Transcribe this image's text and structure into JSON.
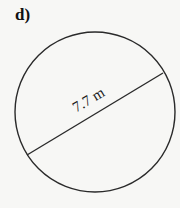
{
  "problem": {
    "label": "d)"
  },
  "figure": {
    "shape": "circle",
    "segment": "diameter",
    "measurement": {
      "value": 7.7,
      "unit": "m",
      "text": "7.7 m"
    },
    "colors": {
      "stroke": "#2a2a2a",
      "background": "#f7f7f5"
    }
  }
}
